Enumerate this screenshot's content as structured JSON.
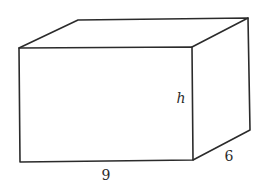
{
  "figure": {
    "type": "rectangular-prism",
    "edge_color": "#2b2b2b",
    "background": "#ffffff",
    "vertices": {
      "front_top_left": [
        19,
        48
      ],
      "front_top_right": [
        192,
        47
      ],
      "front_bottom_right": [
        193,
        160
      ],
      "front_bottom_left": [
        20,
        162
      ],
      "back_top_left": [
        78,
        20
      ],
      "back_top_right": [
        248,
        18
      ],
      "back_bottom_right": [
        250,
        130
      ]
    },
    "labels": {
      "length": {
        "text": "9",
        "x": 106,
        "y": 180,
        "italic": false
      },
      "width": {
        "text": "6",
        "x": 229,
        "y": 161,
        "italic": false
      },
      "height": {
        "text": "h",
        "x": 181,
        "y": 103,
        "italic": true
      }
    }
  }
}
